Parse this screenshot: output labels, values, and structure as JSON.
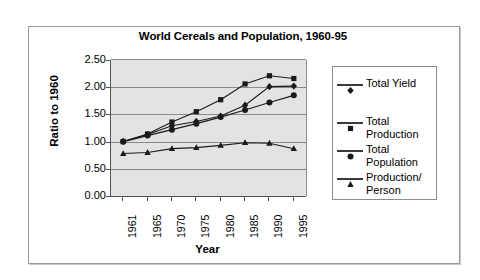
{
  "chart_data": {
    "type": "line",
    "title": "World Cereals and Population, 1960-95",
    "xlabel": "Year",
    "ylabel": "Ratio to 1960",
    "categories": [
      "1961",
      "1965",
      "1970",
      "1975",
      "1980",
      "1985",
      "1990",
      "1995"
    ],
    "ylim": [
      0.0,
      2.5
    ],
    "ytick_labels": [
      "2.50",
      "2.00",
      "1.50",
      "1.00",
      "0.50",
      "0.00"
    ],
    "ytick_values": [
      2.5,
      2.0,
      1.5,
      1.0,
      0.5,
      0.0
    ],
    "grid": true,
    "legend_position": "right",
    "plot_background": "#e3e3e3",
    "series": [
      {
        "name": "Total Yield",
        "marker": "diamond",
        "color": "#1a1a1a",
        "values": [
          1.0,
          1.13,
          1.29,
          1.37,
          1.47,
          1.67,
          2.01,
          2.02
        ]
      },
      {
        "name": "Total Production",
        "marker": "square",
        "color": "#1a1a1a",
        "values": [
          1.0,
          1.14,
          1.36,
          1.55,
          1.77,
          2.06,
          2.21,
          2.16
        ]
      },
      {
        "name": "Total Population",
        "marker": "circle",
        "color": "#1a1a1a",
        "values": [
          1.0,
          1.11,
          1.22,
          1.33,
          1.45,
          1.58,
          1.72,
          1.85
        ]
      },
      {
        "name": "Production/ Person",
        "marker": "triangle",
        "color": "#1a1a1a",
        "values": [
          0.78,
          0.8,
          0.87,
          0.89,
          0.93,
          0.98,
          0.97,
          0.87
        ]
      }
    ]
  },
  "legend": {
    "entries": [
      {
        "label": "Total Yield",
        "marker": "diamond"
      },
      {
        "label": "Total Production",
        "marker": "square"
      },
      {
        "label": "Total Population",
        "marker": "circle"
      },
      {
        "label": "Production/ Person",
        "marker": "triangle"
      }
    ]
  }
}
